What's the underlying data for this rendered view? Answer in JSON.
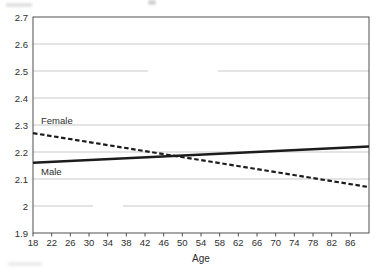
{
  "chart_data": {
    "type": "line",
    "title": "",
    "xlabel": "Age",
    "ylabel": "",
    "xlim": [
      18,
      90
    ],
    "ylim": [
      1.9,
      2.7
    ],
    "grid": true,
    "legend": "inline-labels",
    "x_ticks": [
      18,
      22,
      26,
      30,
      34,
      38,
      42,
      46,
      50,
      54,
      58,
      62,
      66,
      70,
      74,
      78,
      82,
      86
    ],
    "y_ticks": [
      2.7,
      2.6,
      2.5,
      2.4,
      2.3,
      2.2,
      2.1,
      2.0,
      1.9
    ],
    "y_tick_labels": [
      "2.7",
      "2.6",
      "2.5",
      "2.4",
      "2.3",
      "2.2",
      "2.1",
      "2",
      "1.9"
    ],
    "series": [
      {
        "name": "Female",
        "line_style": "dashed",
        "x": [
          18,
          90
        ],
        "values": [
          2.27,
          2.07
        ]
      },
      {
        "name": "Male",
        "line_style": "solid",
        "x": [
          18,
          90
        ],
        "values": [
          2.16,
          2.22
        ]
      }
    ],
    "crossing_point": {
      "age": 49,
      "value": 2.19
    }
  },
  "colors": {
    "line": "#1c1c1c",
    "grid": "#c9c9c9",
    "axis": "#4f4f4f",
    "text": "#2e2e2e",
    "background": "#ffffff"
  }
}
